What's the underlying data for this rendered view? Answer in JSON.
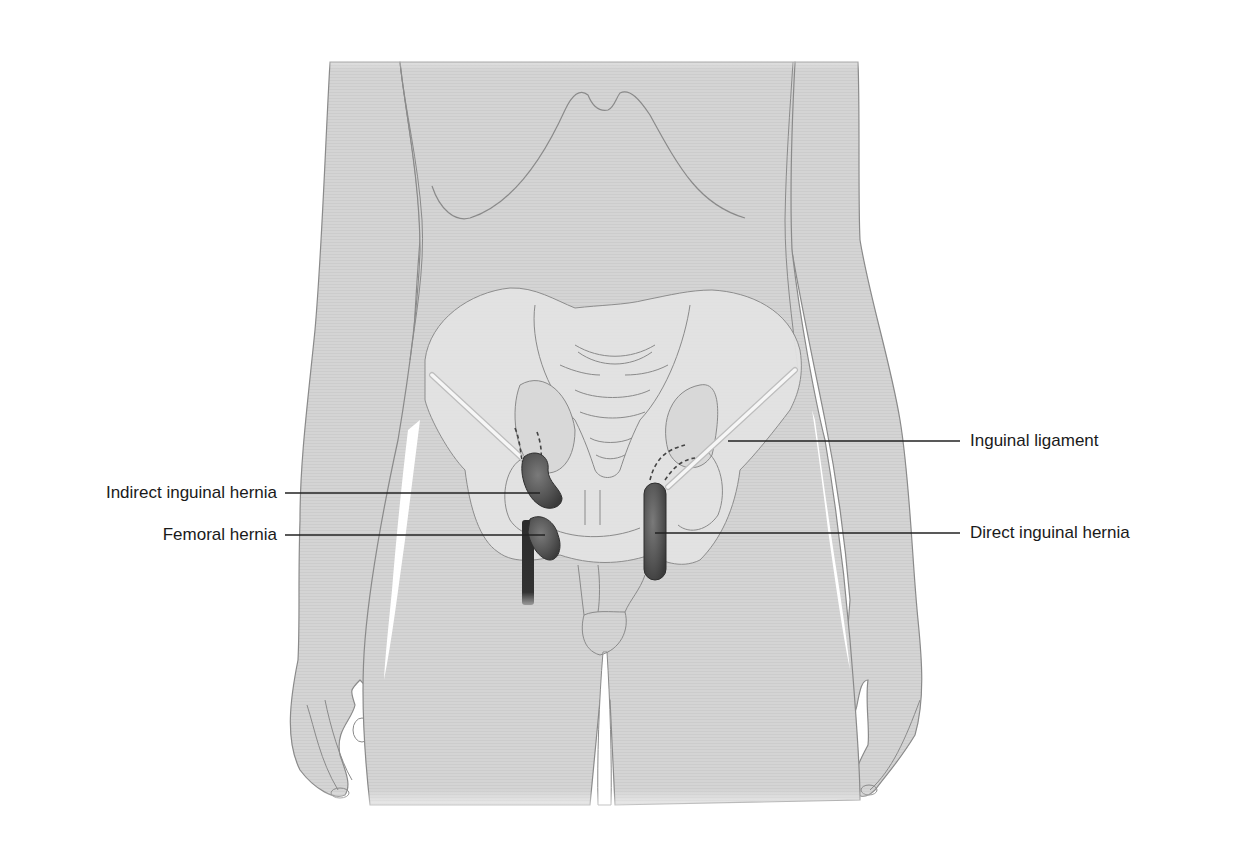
{
  "figure": {
    "colors": {
      "background": "#ffffff",
      "skin_fill": "#d6d6d6",
      "outline": "#8a8a8a",
      "pelvis_fill": "#e2e2e2",
      "hernia_fill": "#5a5a5a",
      "hernia_dark": "#2e2e2e",
      "ligament": "#f4f4f4",
      "leader_line": "#222222",
      "label_text": "#1a1a1a"
    }
  },
  "labels": {
    "inguinal_ligament": "Inguinal ligament",
    "indirect_inguinal_hernia": "Indirect inguinal hernia",
    "femoral_hernia": "Femoral hernia",
    "direct_inguinal_hernia": "Direct inguinal hernia"
  }
}
